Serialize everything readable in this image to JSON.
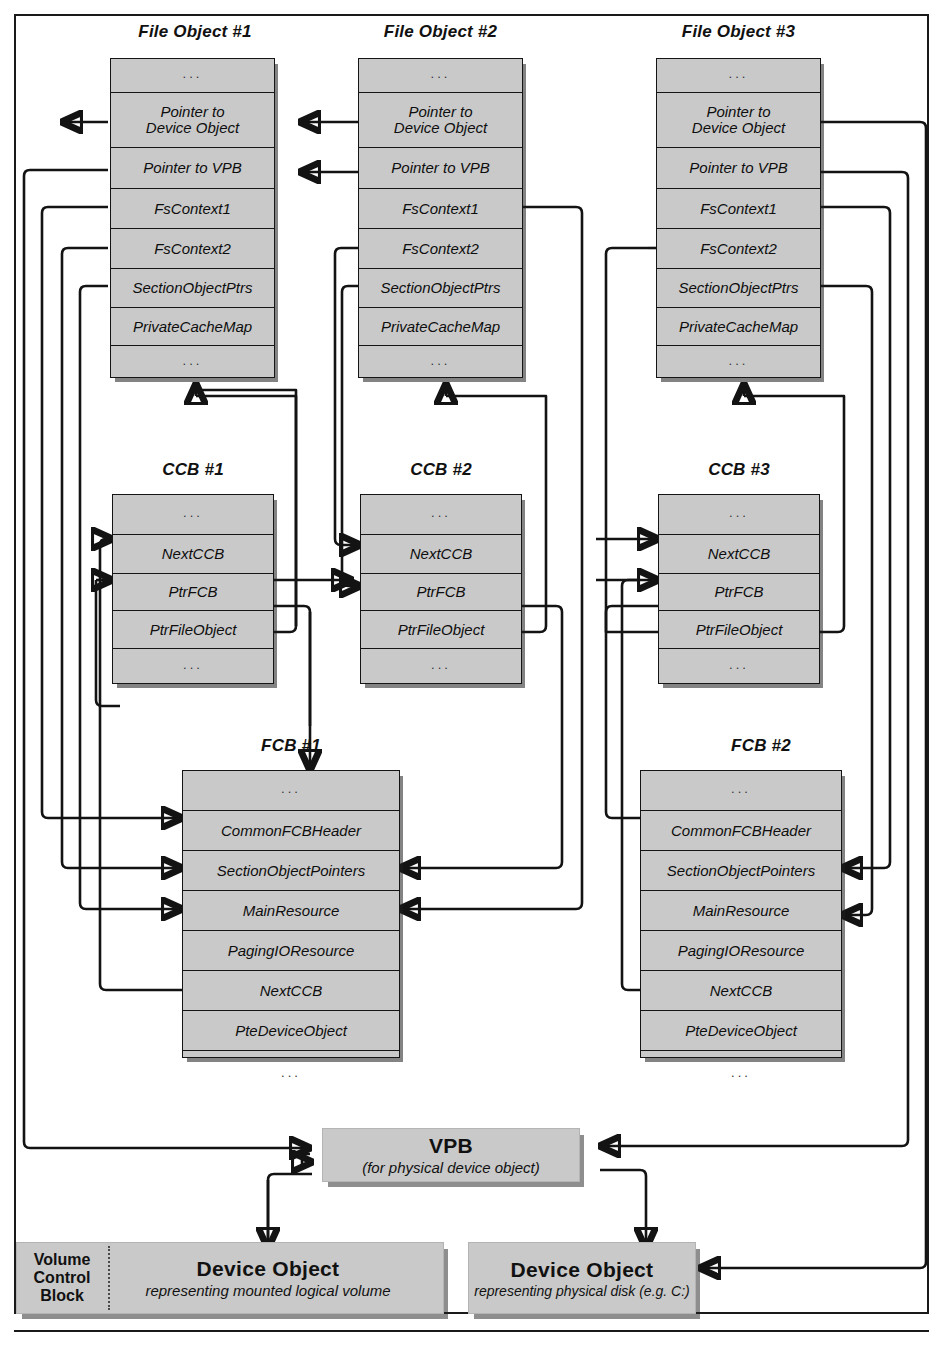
{
  "diagram": {
    "colors": {
      "box_fill": "#c9c9c9",
      "line": "#131313",
      "frame": "#1a1a1a"
    }
  },
  "file_objects": [
    {
      "title": "File Object #1",
      "rows": [
        "...",
        "Pointer to\nDevice Object",
        "Pointer to VPB",
        "FsContext1",
        "FsContext2",
        "SectionObjectPtrs",
        "PrivateCacheMap",
        "..."
      ]
    },
    {
      "title": "File Object #2",
      "rows": [
        "...",
        "Pointer to\nDevice Object",
        "Pointer to VPB",
        "FsContext1",
        "FsContext2",
        "SectionObjectPtrs",
        "PrivateCacheMap",
        "..."
      ]
    },
    {
      "title": "File Object #3",
      "rows": [
        "...",
        "Pointer to\nDevice Object",
        "Pointer to VPB",
        "FsContext1",
        "FsContext2",
        "SectionObjectPtrs",
        "PrivateCacheMap",
        "..."
      ]
    }
  ],
  "ccbs": [
    {
      "title": "CCB #1",
      "rows": [
        "...",
        "NextCCB",
        "PtrFCB",
        "PtrFileObject",
        "..."
      ]
    },
    {
      "title": "CCB #2",
      "rows": [
        "...",
        "NextCCB",
        "PtrFCB",
        "PtrFileObject",
        "..."
      ]
    },
    {
      "title": "CCB #3",
      "rows": [
        "...",
        "NextCCB",
        "PtrFCB",
        "PtrFileObject",
        "..."
      ]
    }
  ],
  "fcbs": [
    {
      "title": "FCB #1",
      "rows": [
        "...",
        "CommonFCBHeader",
        "SectionObjectPointers",
        "MainResource",
        "PagingIOResource",
        "NextCCB",
        "PteDeviceObject",
        "..."
      ]
    },
    {
      "title": "FCB #2",
      "rows": [
        "...",
        "CommonFCBHeader",
        "SectionObjectPointers",
        "MainResource",
        "PagingIOResource",
        "NextCCB",
        "PteDeviceObject",
        "..."
      ]
    }
  ],
  "vpb": {
    "title": "VPB",
    "subtitle": "(for physical device object)"
  },
  "volume_control_block": {
    "line1": "Volume",
    "line2": "Control",
    "line3": "Block"
  },
  "device_objects": [
    {
      "title": "Device Object",
      "subtitle": "representing mounted logical volume"
    },
    {
      "title": "Device Object",
      "subtitle": "representing physical disk (e.g. C:)"
    }
  ]
}
